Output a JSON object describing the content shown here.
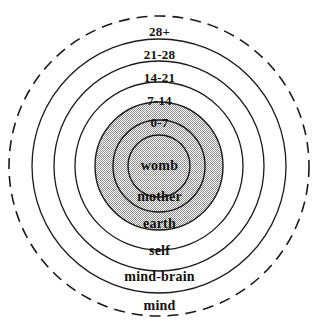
{
  "figure": {
    "type": "concentric-circles-diagram",
    "title": "",
    "center": {
      "x": 159,
      "y": 166
    },
    "background_color": "#ffffff",
    "line_color": "#1a1a1a",
    "shade_color": "#b9b9b9",
    "text_color": "#111111"
  },
  "rings": [
    {
      "id": "mind",
      "label": "mind",
      "age_label": "",
      "radius": 150,
      "stroke": "dashed",
      "shaded": false,
      "label_y": 305
    },
    {
      "id": "mind-brain",
      "label": "mind-brain",
      "age_label": "",
      "radius": 127,
      "stroke": "solid",
      "shaded": false,
      "label_y": 277
    },
    {
      "id": "self",
      "label": "self",
      "age_label": "28+",
      "radius": 105,
      "stroke": "solid",
      "shaded": false,
      "label_y": 250,
      "age_y": 32
    },
    {
      "id": "earth",
      "label": "earth",
      "age_label": "21-28",
      "radius": 84,
      "stroke": "solid",
      "shaded": false,
      "label_y": 223,
      "age_y": 55
    },
    {
      "id": "mother",
      "label": "mother",
      "age_label": "14-21",
      "radius": 64,
      "stroke": "solid",
      "shaded": true,
      "label_y": 196,
      "age_y": 78
    },
    {
      "id": "band-7-14",
      "label": "",
      "age_label": "7-14",
      "radius": 46,
      "stroke": "solid",
      "shaded": true,
      "age_y": 101
    },
    {
      "id": "band-0-7",
      "label": "",
      "age_label": "0-7",
      "radius": 31,
      "stroke": "solid",
      "shaded": true,
      "age_y": 122
    },
    {
      "id": "womb",
      "label": "womb",
      "age_label": "",
      "radius": 31,
      "stroke": "solid",
      "shaded": true,
      "label_y": 159
    }
  ],
  "labels": {
    "age_28_plus": "28+",
    "age_21_28": "21-28",
    "age_14_21": "14-21",
    "age_7_14": "7-14",
    "age_0_7": "0-7",
    "womb": "womb",
    "mother": "mother",
    "earth": "earth",
    "self": "self",
    "mind_brain": "mind-brain",
    "mind": "mind"
  }
}
